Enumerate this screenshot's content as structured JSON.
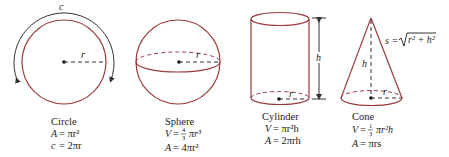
{
  "figure": {
    "colors": {
      "outline": "#9a3a3a",
      "ink": "#333333",
      "text": "#222222"
    },
    "shapes": [
      {
        "id": "circle",
        "name": "Circle",
        "dimension_labels": {
          "circumference": "c",
          "radius": "r"
        },
        "formulas": [
          {
            "lhs": "A",
            "rhs": "= πr²"
          },
          {
            "lhs": "c",
            "rhs": "= 2πr"
          }
        ]
      },
      {
        "id": "sphere",
        "name": "Sphere",
        "dimension_labels": {
          "radius": "r"
        },
        "formulas": [
          {
            "lhs": "V",
            "rhs": "= 4/3 πr³",
            "frac_num": "4",
            "frac_den": "3",
            "after_frac": "πr³"
          },
          {
            "lhs": "A",
            "rhs": "= 4πr²"
          }
        ]
      },
      {
        "id": "cylinder",
        "name": "Cylinder",
        "dimension_labels": {
          "height": "h",
          "radius": "r"
        },
        "formulas": [
          {
            "lhs": "V",
            "rhs": "= πr²h"
          },
          {
            "lhs": "A",
            "rhs": "= 2πrh"
          }
        ]
      },
      {
        "id": "cone",
        "name": "Cone",
        "dimension_labels": {
          "height": "h",
          "radius": "r",
          "slant": "s = √(r² + h²)",
          "slant_lhs": "s =",
          "slant_rad": "r² + h²"
        },
        "formulas": [
          {
            "lhs": "V",
            "rhs": "= 1/3 πr²h",
            "frac_num": "1",
            "frac_den": "3",
            "after_frac": "πr²h"
          },
          {
            "lhs": "A",
            "rhs": "= πrs"
          }
        ]
      }
    ]
  }
}
